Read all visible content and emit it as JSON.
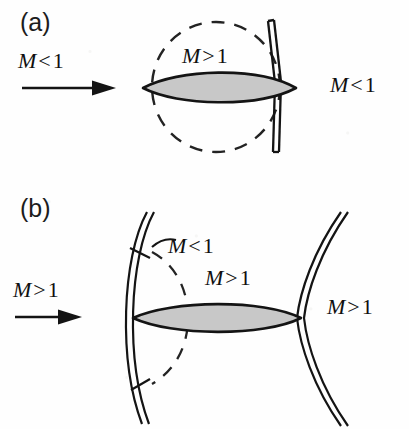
{
  "figure": {
    "type": "diagram",
    "background_color": "#fefefe",
    "ink_color": "#101010",
    "airfoil_fill_color": "#c8c8c8",
    "airfoil_outline_color": "#141414"
  },
  "panels": [
    {
      "id": "a",
      "label": "(a)",
      "description": "Subsonic freestream with embedded supersonic pocket terminated by a normal shock",
      "freestream_label": "M < 1",
      "freestream_mach_symbol": "M",
      "freestream_operator": "<",
      "freestream_value": "1",
      "downstream_label": "M < 1",
      "downstream_mach_symbol": "M",
      "downstream_operator": "<",
      "downstream_value": "1",
      "pocket_label": "M > 1",
      "pocket_mach_symbol": "M",
      "pocket_operator": ">",
      "pocket_value": "1",
      "features": [
        "incoming-flow-arrow",
        "airfoil",
        "sonic-line-dashed-ellipse",
        "normal-shock-double-line"
      ]
    },
    {
      "id": "b",
      "label": "(b)",
      "description": "Supersonic freestream with detached bow shock, subsonic pocket behind it and trailing oblique shock",
      "freestream_label": "M > 1",
      "freestream_mach_symbol": "M",
      "freestream_operator": ">",
      "freestream_value": "1",
      "downstream_label": "M > 1",
      "downstream_mach_symbol": "M",
      "downstream_operator": ">",
      "downstream_value": "1",
      "subsonic_pocket_label": "M < 1",
      "subsonic_pocket_mach_symbol": "M",
      "subsonic_pocket_operator": "<",
      "subsonic_pocket_value": "1",
      "supersonic_region_label": "M > 1",
      "supersonic_region_mach_symbol": "M",
      "supersonic_region_operator": ">",
      "supersonic_region_value": "1",
      "features": [
        "incoming-flow-arrow",
        "airfoil",
        "bow-shock-double-curve",
        "sonic-line-dashed-arc",
        "trailing-shock-double-curve",
        "leader-ticks"
      ]
    }
  ]
}
